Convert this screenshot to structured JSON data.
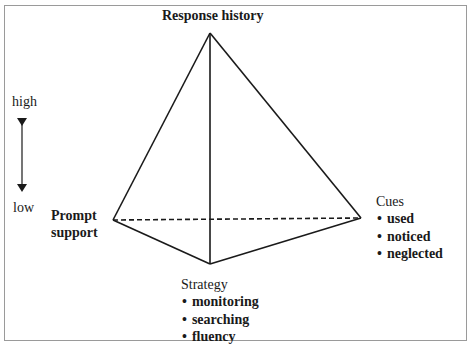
{
  "diagram": {
    "type": "tetrahedron",
    "vertices": {
      "top": {
        "label": "Response history",
        "x": 210,
        "y": 33
      },
      "left": {
        "label": "Prompt support",
        "x": 113,
        "y": 220
      },
      "right": {
        "label": "Cues",
        "x": 361,
        "y": 218
      },
      "bottom": {
        "label": "Strategy",
        "x": 210,
        "y": 264
      }
    },
    "edges": [
      {
        "from": "top",
        "to": "left",
        "style": "solid"
      },
      {
        "from": "top",
        "to": "right",
        "style": "solid"
      },
      {
        "from": "top",
        "to": "bottom",
        "style": "solid"
      },
      {
        "from": "left",
        "to": "bottom",
        "style": "solid"
      },
      {
        "from": "right",
        "to": "bottom",
        "style": "solid"
      },
      {
        "from": "left",
        "to": "right",
        "style": "dashed"
      }
    ],
    "colors": {
      "line": "#1a1a1a",
      "frame": "#9a9a9a",
      "background": "#ffffff"
    }
  },
  "labels": {
    "response_history": "Response history",
    "prompt_support_line1": "Prompt",
    "prompt_support_line2": "support",
    "cues_title": "Cues",
    "cues_items": [
      "used",
      "noticed",
      "neglected"
    ],
    "strategy_title": "Strategy",
    "strategy_items": [
      "monitoring",
      "searching",
      "fluency"
    ]
  },
  "scale": {
    "high_label": "high",
    "low_label": "low",
    "arrow": "double-headed vertical"
  }
}
